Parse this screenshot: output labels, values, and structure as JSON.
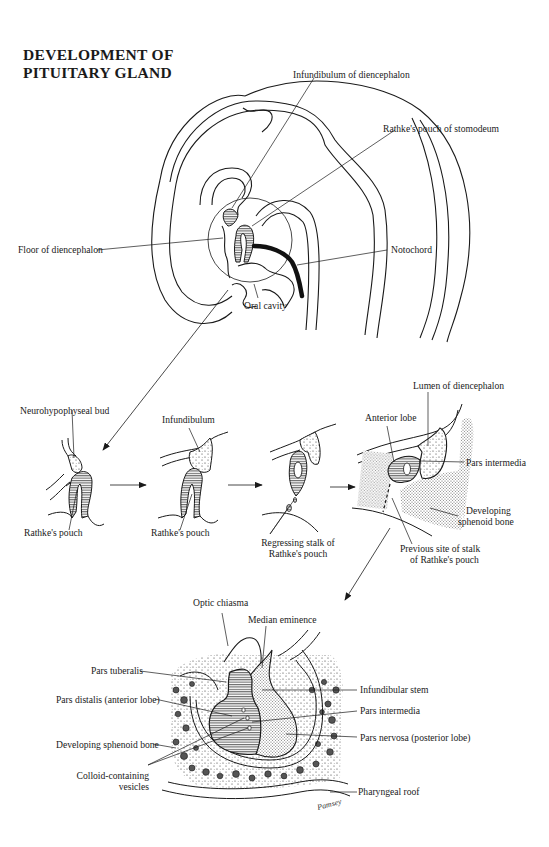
{
  "title": {
    "line1": "DEVELOPMENT OF",
    "line2": "PITUITARY GLAND"
  },
  "panel_embryo": {
    "labels": {
      "infundibulum_of_diencephalon": "Infundibulum of diencephalon",
      "rathkes_pouch_of_stomodeum": "Rathke's pouch of stomodeum",
      "floor_of_diencephalon": "Floor of diencephalon",
      "notochord": "Notochord",
      "oral_cavity": "Oral cavity"
    }
  },
  "panel_stages": {
    "stage1": {
      "top": "Neurohypophyseal bud",
      "bottom": "Rathke's pouch"
    },
    "stage2": {
      "top": "Infundibulum",
      "bottom": "Rathke's pouch"
    },
    "stage3": {
      "bottom_line1": "Regressing stalk of",
      "bottom_line2": "Rathke's pouch"
    },
    "stage4": {
      "lumen": "Lumen of diencephalon",
      "anterior_lobe": "Anterior lobe",
      "pars_intermedia": "Pars intermedia",
      "sphenoid_line1": "Developing",
      "sphenoid_line2": "sphenoid bone",
      "previous_site_line1": "Previous site of stalk",
      "previous_site_line2": "of Rathke's pouch"
    }
  },
  "panel_final": {
    "labels": {
      "optic_chiasma": "Optic chiasma",
      "median_eminence": "Median eminence",
      "pars_tuberalis": "Pars tuberalis",
      "infundibular_stem": "Infundibular stem",
      "pars_distalis": "Pars distalis (anterior lobe)",
      "pars_intermedia": "Pars intermedia",
      "developing_sphenoid_bone": "Developing sphenoid bone",
      "pars_nervosa": "Pars nervosa (posterior lobe)",
      "colloid_line1": "Colloid-containing",
      "colloid_line2": "vesicles",
      "pharyngeal_roof": "Pharyngeal roof"
    },
    "signature": "Pamsey"
  }
}
